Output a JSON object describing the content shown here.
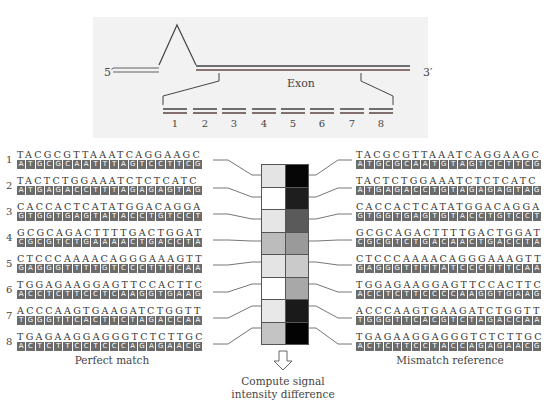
{
  "gene": {
    "five_prime": "5′",
    "three_prime": "3′",
    "exon_label": "Exon",
    "fragments": [
      "1",
      "2",
      "3",
      "4",
      "5",
      "6",
      "7",
      "8"
    ]
  },
  "perfect_match": {
    "label": "Perfect match",
    "rows": [
      {
        "num": "1",
        "top": "TACGCGTTAAATCAGGAAGC",
        "bottom": "ATGCGCAATTTAGTCCTTCG"
      },
      {
        "num": "2",
        "top": "TACTCTGGAAATCTCTCATC",
        "bottom": "ATGAGACCTTTAGAGAGTAG"
      },
      {
        "num": "3",
        "top": "CACCACTCATATGGACAGGA",
        "bottom": "GTGGTGAGTATACCTGTCCT"
      },
      {
        "num": "4",
        "top": "GCGCAGACTTTTGACTGGAT",
        "bottom": "CGCGTCTGAAAACTGACCTA"
      },
      {
        "num": "5",
        "top": "CTCCCAAAACAGGGAAAGTT",
        "bottom": "GAGGGTTTTGTCCCTTTCAA"
      },
      {
        "num": "6",
        "top": "TGGAGAAGGAGTTCCACTTC",
        "bottom": "ACCTCTTCCTCAAGGTGAAG"
      },
      {
        "num": "7",
        "top": "ACCCAAGTGAAGATCTGGTT",
        "bottom": "TGGGTTCACTTCTAGACCAA"
      },
      {
        "num": "8",
        "top": "TGAGAAGGAGGGTCTCTTGC",
        "bottom": "ACTCTTCCTCCCAGAGAACG"
      }
    ]
  },
  "mismatch": {
    "label": "Mismatch reference",
    "rows": [
      {
        "top": "TACGCGTTAAATCAGGAAGC",
        "bottom": "ATGCGCAATGTAGTCCTTCG"
      },
      {
        "top": "TACTCTGGAAATCTCTCATC",
        "bottom": "ATGAGACCTGTAGAGAGTAG"
      },
      {
        "top": "CACCACTCATATGGACAGGA",
        "bottom": "GTGGTGAGTGTACCTGTCCT"
      },
      {
        "top": "GCGCAGACTTTTGACTGGAT",
        "bottom": "CGCGTCTGACAACTGACCTA"
      },
      {
        "top": "CTCCCAAAACAGGGAAAGTT",
        "bottom": "GAGGGTTTTATCCCTTTCAA"
      },
      {
        "top": "TGGAGAAGGAGTTCCACTTC",
        "bottom": "ACCTCTTCCCCAAGGTGAAG"
      },
      {
        "top": "ACCCAAGTGAAGATCTGGTT",
        "bottom": "TGGGTTCACGTCTAGACCAA"
      },
      {
        "top": "TGAGAAGGAGGGTCTCTTGC",
        "bottom": "ACTCTTCCTACCAGAGAACG"
      }
    ]
  },
  "probe_cells": [
    {
      "pm": "#e4e4e4",
      "mm": "#060606"
    },
    {
      "pm": "#ffffff",
      "mm": "#1e1e1e"
    },
    {
      "pm": "#e6e6e6",
      "mm": "#5a5a5a"
    },
    {
      "pm": "#bcbcbc",
      "mm": "#9a9a9a"
    },
    {
      "pm": "#e4e4e4",
      "mm": "#cacaca"
    },
    {
      "pm": "#ffffff",
      "mm": "#a8a8a8"
    },
    {
      "pm": "#e8e8e8",
      "mm": "#1a1a1a"
    },
    {
      "pm": "#c4c4c4",
      "mm": "#030303"
    }
  ],
  "compute": {
    "line1": "Compute signal",
    "line2": "intensity difference"
  }
}
